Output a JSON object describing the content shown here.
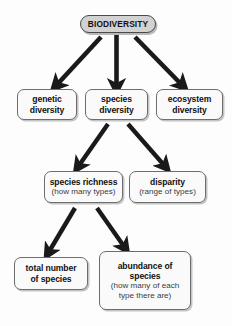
{
  "diagram": {
    "type": "flowchart",
    "background_color": "#fdfdfd",
    "arrow_color": "#1a1a1a",
    "root_fill_color": "#d2d2d2",
    "node_fill_color": "#fafafa",
    "node_border_color": "#6d6d6d",
    "nodes": {
      "biodiversity": {
        "label": "BIODIVERSITY"
      },
      "genetic": {
        "line1": "genetic",
        "line2": "diversity"
      },
      "species": {
        "line1": "species",
        "line2": "diversity"
      },
      "ecosystem": {
        "line1": "ecosystem",
        "line2": "diversity"
      },
      "richness": {
        "title": "species richness",
        "sub": "(how many types)"
      },
      "disparity": {
        "title": "disparity",
        "sub": "(range of types)"
      },
      "total": {
        "line1": "total number",
        "line2": "of species"
      },
      "abundance": {
        "line1": "abundance of",
        "line2": "species",
        "sub1": "(how many of each",
        "sub2": "type there are)"
      }
    },
    "edges": [
      {
        "from": "biodiversity",
        "to": "genetic",
        "style": "thick-arrow"
      },
      {
        "from": "biodiversity",
        "to": "species",
        "style": "thick-arrow"
      },
      {
        "from": "biodiversity",
        "to": "ecosystem",
        "style": "thick-arrow"
      },
      {
        "from": "species",
        "to": "richness",
        "style": "thick-arrow"
      },
      {
        "from": "species",
        "to": "disparity",
        "style": "thick-arrow"
      },
      {
        "from": "richness",
        "to": "total",
        "style": "thick-arrow"
      },
      {
        "from": "richness",
        "to": "abundance",
        "style": "thick-arrow"
      }
    ]
  }
}
